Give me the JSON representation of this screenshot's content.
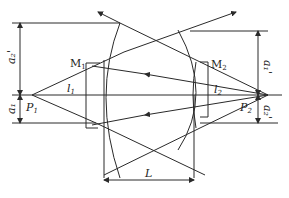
{
  "diagram": {
    "type": "optical-lens-ray-diagram",
    "labels": {
      "a2_prime": "a₂'",
      "a1": "a₁",
      "a1_prime": "a₁'",
      "a2": "a₂'",
      "M1": "M",
      "M1_sub": "1",
      "M2": "M",
      "M2_sub": "2",
      "l1": "l",
      "l1_sub": "1",
      "l2": "l",
      "l2_sub": "2",
      "P1": "P",
      "P1_sub": "1",
      "P2": "P",
      "P2_sub": "2",
      "L": "L"
    },
    "colors": {
      "stroke": "#2a2a2a",
      "background": "#ffffff"
    }
  }
}
